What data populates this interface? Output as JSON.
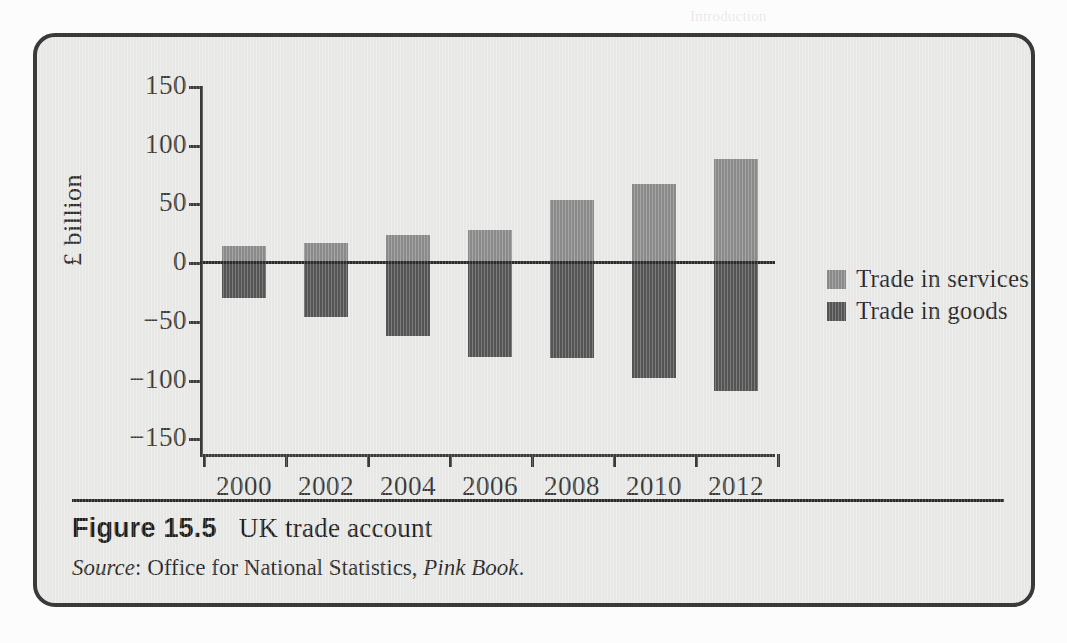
{
  "figure": {
    "number": "Figure 15.5",
    "title": "UK trade account",
    "source_prefix": "Source",
    "source_sep": ": ",
    "source_org": "Office for National Statistics, ",
    "source_pub": "Pink Book",
    "source_end": "."
  },
  "colors": {
    "services": "#8b8b8b",
    "goods": "#555555",
    "panel_background": "#e9e9e7",
    "panel_border": "#3a3a3a",
    "axis": "#3a3a3a",
    "text": "#2b2b2b"
  },
  "legend": {
    "items": [
      {
        "label": "Trade in services",
        "color": "#8b8b8b"
      },
      {
        "label": "Trade in goods",
        "color": "#555555"
      }
    ]
  },
  "background_text": {
    "lines": [
      "Introduction",
      "Trade in goods and services between countries is a central feature of the",
      "modern economy. Why do countries trade? Why can countries benefit from it? How",
      "can a country's terms of trade be measured and what are the predictions of",
      "theory about the trade deficit? These are some of the questions to be addressed.",
      "In this chapter we examine the determinants of trade flows.",
      "We look at how a country's relative prices and the exchange rate influence trade.",
      "The analysis builds on the macroeconomic model developed earlier.",
      "We then consider the role of the balance of payments and the capital account.",
      "Finally we discuss what drives long run competitiveness of an economy.",
      "We do not provide a number of worked examples throughout this chapter.",
      "All of these questions are explored in the sections that follow below."
    ]
  },
  "chart_data": {
    "type": "bar",
    "title": "UK trade account",
    "xlabel": "",
    "ylabel": "£ billion",
    "categories": [
      "2000",
      "2002",
      "2004",
      "2006",
      "2008",
      "2010",
      "2012"
    ],
    "ylim": [
      -150,
      150
    ],
    "yticks": [
      150,
      100,
      50,
      0,
      -50,
      -100,
      -150
    ],
    "ytick_labels": [
      "150",
      "100",
      "50",
      "0",
      "−50",
      "−100",
      "−150"
    ],
    "grid": false,
    "legend_position": "right-middle",
    "series": [
      {
        "name": "Trade in services",
        "color": "#8b8b8b",
        "values": [
          14,
          16,
          23,
          27,
          53,
          66,
          88
        ]
      },
      {
        "name": "Trade in goods",
        "color": "#555555",
        "values": [
          -31,
          -47,
          -63,
          -81,
          -82,
          -99,
          -110
        ]
      }
    ]
  }
}
